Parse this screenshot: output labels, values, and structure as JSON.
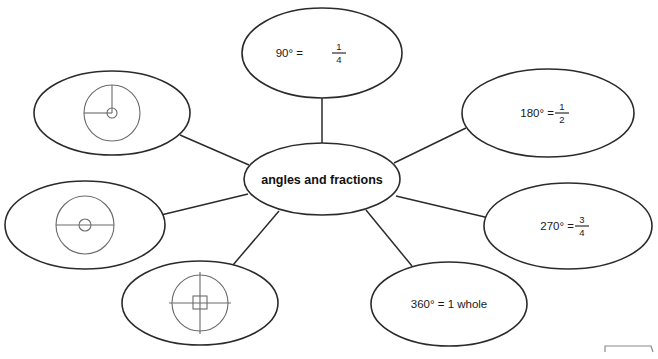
{
  "diagram": {
    "type": "concept-map",
    "title_visible": false,
    "center": {
      "label": "angles and fractions",
      "cx": 322,
      "cy": 179,
      "rx": 78,
      "ry": 36
    },
    "colors": {
      "background": "#ffffff",
      "outline": "#2b2b2b",
      "icon_outline": "#6b6b6b",
      "text": "#1a1a1a"
    },
    "nodes": [
      {
        "id": "node-90",
        "kind": "text",
        "text_before": "90° =",
        "numerator": "1",
        "denominator": "4",
        "full_text": "90° = 1/4",
        "cx": 322,
        "cy": 53,
        "rx": 80,
        "ry": 45
      },
      {
        "id": "node-180",
        "kind": "text",
        "text_before": "180° =",
        "numerator": "1",
        "denominator": "2",
        "full_text": "180° = 1/2",
        "cx": 548,
        "cy": 113,
        "rx": 86,
        "ry": 44
      },
      {
        "id": "node-270",
        "kind": "text",
        "text_before": "270° =",
        "numerator": "3",
        "denominator": "4",
        "full_text": "270° = 3/4",
        "cx": 568,
        "cy": 226,
        "rx": 84,
        "ry": 43
      },
      {
        "id": "node-360",
        "kind": "text",
        "text_before": "360° = 1 whole",
        "numerator": "",
        "denominator": "",
        "full_text": "360° = 1 whole",
        "cx": 449,
        "cy": 304,
        "rx": 78,
        "ry": 42
      },
      {
        "id": "node-icon-quarter",
        "kind": "icon",
        "icon": "circle-quarter-turn-icon",
        "icon_description": "circle with radius up and radius left showing a quarter turn",
        "cx": 112,
        "cy": 113,
        "rx": 78,
        "ry": 42
      },
      {
        "id": "node-icon-half",
        "kind": "icon",
        "icon": "circle-half-turn-icon",
        "icon_description": "circle with horizontal diameter showing a half turn",
        "cx": 85,
        "cy": 225,
        "rx": 80,
        "ry": 44
      },
      {
        "id": "node-icon-whole",
        "kind": "icon",
        "icon": "circle-full-turn-icon",
        "icon_description": "circle with vertical and horizontal diameters and a square at the centre showing a full turn",
        "cx": 200,
        "cy": 303,
        "rx": 78,
        "ry": 42
      }
    ],
    "connectors": [
      {
        "from": "center",
        "to": "node-90",
        "x1": 322,
        "y1": 143,
        "x2": 322,
        "y2": 98
      },
      {
        "from": "center",
        "to": "node-180",
        "x1": 394,
        "y1": 163,
        "x2": 466,
        "y2": 128
      },
      {
        "from": "center",
        "to": "node-270",
        "x1": 396,
        "y1": 196,
        "x2": 489,
        "y2": 218
      },
      {
        "from": "center",
        "to": "node-360",
        "x1": 366,
        "y1": 210,
        "x2": 412,
        "y2": 266
      },
      {
        "from": "center",
        "to": "node-icon-quarter",
        "x1": 249,
        "y1": 165,
        "x2": 180,
        "y2": 135
      },
      {
        "from": "center",
        "to": "node-icon-half",
        "x1": 248,
        "y1": 194,
        "x2": 161,
        "y2": 215
      },
      {
        "from": "center",
        "to": "node-icon-whole",
        "x1": 279,
        "y1": 211,
        "x2": 233,
        "y2": 265
      }
    ],
    "corner_fragment": {
      "visible": true,
      "description": "partial rule fragment at bottom right edge"
    }
  }
}
